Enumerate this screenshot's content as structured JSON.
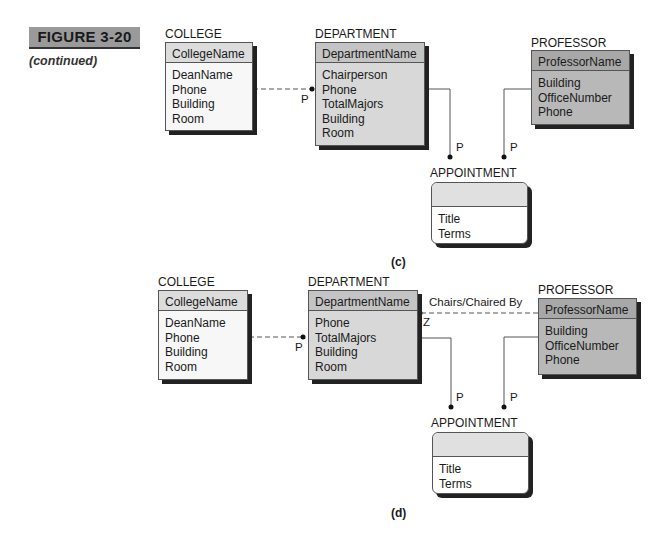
{
  "figure": {
    "title": "FIGURE 3-20",
    "subtitle": "(continued)"
  },
  "diagram_c": {
    "caption": "(c)",
    "college": {
      "name": "COLLEGE",
      "key": "CollegeName",
      "attributes": [
        "DeanName",
        "Phone",
        "Building",
        "Room"
      ]
    },
    "department": {
      "name": "DEPARTMENT",
      "key": "DepartmentName",
      "attributes": [
        "Chairperson",
        "Phone",
        "TotalMajors",
        "Building",
        "Room"
      ]
    },
    "professor": {
      "name": "PROFESSOR",
      "key": "ProfessorName",
      "attributes": [
        "Building",
        "OfficeNumber",
        "Phone"
      ]
    },
    "appointment": {
      "name": "APPOINTMENT",
      "key": "",
      "attributes": [
        "Title",
        "Terms"
      ]
    },
    "relationships": [
      {
        "from": "COLLEGE",
        "to": "DEPARTMENT",
        "style": "dashed",
        "cardinality": "P"
      },
      {
        "from": "DEPARTMENT",
        "to": "APPOINTMENT",
        "style": "solid",
        "cardinality": "P"
      },
      {
        "from": "PROFESSOR",
        "to": "APPOINTMENT",
        "style": "solid",
        "cardinality": "P"
      }
    ]
  },
  "diagram_d": {
    "caption": "(d)",
    "college": {
      "name": "COLLEGE",
      "key": "CollegeName",
      "attributes": [
        "DeanName",
        "Phone",
        "Building",
        "Room"
      ]
    },
    "department": {
      "name": "DEPARTMENT",
      "key": "DepartmentName",
      "attributes": [
        "Phone",
        "TotalMajors",
        "Building",
        "Room"
      ]
    },
    "professor": {
      "name": "PROFESSOR",
      "key": "ProfessorName",
      "attributes": [
        "Building",
        "OfficeNumber",
        "Phone"
      ]
    },
    "appointment": {
      "name": "APPOINTMENT",
      "key": "",
      "attributes": [
        "Title",
        "Terms"
      ]
    },
    "relationships": [
      {
        "from": "COLLEGE",
        "to": "DEPARTMENT",
        "style": "dashed",
        "cardinality": "P"
      },
      {
        "from": "PROFESSOR",
        "to": "DEPARTMENT",
        "style": "dashed",
        "cardinality": "Z",
        "label": "Chairs/Chaired By"
      },
      {
        "from": "DEPARTMENT",
        "to": "APPOINTMENT",
        "style": "solid",
        "cardinality": "P"
      },
      {
        "from": "PROFESSOR",
        "to": "APPOINTMENT",
        "style": "solid",
        "cardinality": "P"
      }
    ]
  }
}
